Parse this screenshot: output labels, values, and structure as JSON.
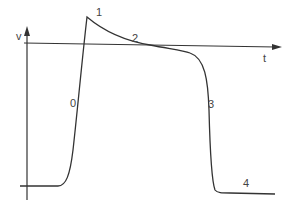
{
  "diagram": {
    "axes": {
      "y_label": "v",
      "x_label": "t"
    },
    "phase_labels": [
      {
        "id": "phase-0",
        "text": "0",
        "x": 70,
        "y": 107
      },
      {
        "id": "phase-1",
        "text": "1",
        "x": 96,
        "y": 16
      },
      {
        "id": "phase-2",
        "text": "2",
        "x": 132,
        "y": 42
      },
      {
        "id": "phase-3",
        "text": "3",
        "x": 208,
        "y": 108
      },
      {
        "id": "phase-4",
        "text": "4",
        "x": 243,
        "y": 187
      }
    ],
    "colors": {
      "line": "#333333",
      "label": "#444444",
      "background": "#ffffff"
    }
  }
}
